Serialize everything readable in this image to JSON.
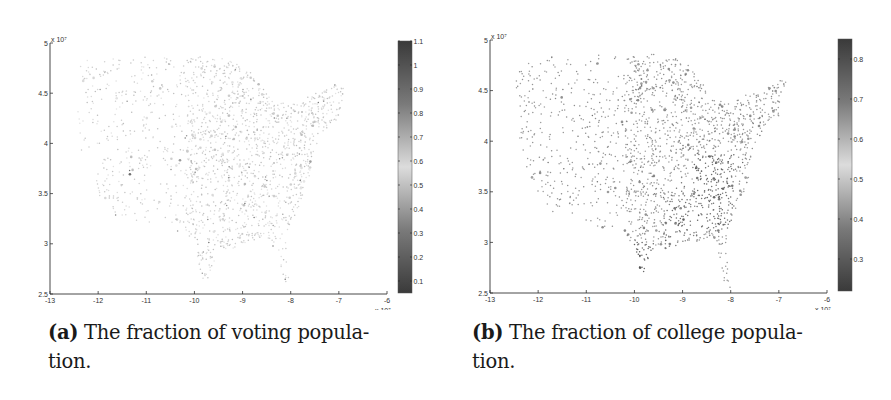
{
  "figure": {
    "panels": [
      {
        "id": "a",
        "caption_label": "(a)",
        "caption_line1": " The fraction of voting popula-",
        "caption_line2": "tion.",
        "colorbar_ticks": [
          "0.1",
          "0.2",
          "0.3",
          "0.4",
          "0.5",
          "0.6",
          "0.7",
          "0.8",
          "0.9",
          "1",
          "1.1"
        ],
        "colorbar_range": [
          0.05,
          1.1
        ]
      },
      {
        "id": "b",
        "caption_label": "(b)",
        "caption_line1": " The fraction of college popula-",
        "caption_line2": "tion.",
        "colorbar_ticks": [
          "0.3",
          "0.4",
          "0.5",
          "0.6",
          "0.7",
          "0.8"
        ],
        "colorbar_range": [
          0.22,
          0.85
        ]
      }
    ],
    "x_ticks": [
      "-13",
      "-12",
      "-11",
      "-10",
      "-9",
      "-8",
      "-7",
      "-6"
    ],
    "y_ticks": [
      "2.5",
      "3",
      "3.5",
      "4",
      "4.5",
      "5"
    ],
    "x_multiplier": "x 10⁷",
    "y_multiplier": "x 10⁷"
  },
  "chart_data": [
    {
      "type": "scatter",
      "title": "(a) The fraction of voting population.",
      "xlabel": "",
      "ylabel": "",
      "xlim": [
        -13,
        -6
      ],
      "ylim": [
        2.5,
        5
      ],
      "x_scale_multiplier": "1e7",
      "y_scale_multiplier": "1e7",
      "x_ticks": [
        -13,
        -12,
        -11,
        -10,
        -9,
        -8,
        -7,
        -6
      ],
      "y_ticks": [
        2.5,
        3,
        3.5,
        4,
        4.5,
        5
      ],
      "colorbar": {
        "min": 0.05,
        "max": 1.1,
        "ticks": [
          0.1,
          0.2,
          0.3,
          0.4,
          0.5,
          0.6,
          0.7,
          0.8,
          0.9,
          1,
          1.1
        ],
        "colormap": "grayscale (dark-light-dark)"
      },
      "description": "Scatter of US county centroids (map of contiguous United States) colored by fraction of voting population; mostly mid values (~0.6-0.7), darker concentrations in southeast",
      "grid": false
    },
    {
      "type": "scatter",
      "title": "(b) The fraction of college population.",
      "xlabel": "",
      "ylabel": "",
      "xlim": [
        -13,
        -6
      ],
      "ylim": [
        2.5,
        5
      ],
      "x_scale_multiplier": "1e7",
      "y_scale_multiplier": "1e7",
      "x_ticks": [
        -13,
        -12,
        -11,
        -10,
        -9,
        -8,
        -7,
        -6
      ],
      "y_ticks": [
        2.5,
        3,
        3.5,
        4,
        4.5,
        5
      ],
      "colorbar": {
        "min": 0.22,
        "max": 0.85,
        "ticks": [
          0.3,
          0.4,
          0.5,
          0.6,
          0.7,
          0.8
        ],
        "colormap": "grayscale (dark-light-dark)"
      },
      "description": "Scatter of US county centroids colored by fraction of college population; dark clusters in southeast (Appalachia, Deep South) and south Texas",
      "grid": false
    }
  ]
}
